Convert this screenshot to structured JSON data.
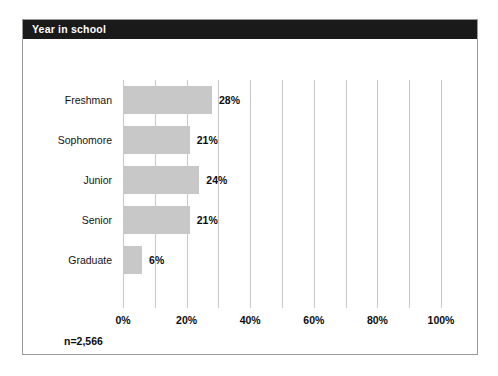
{
  "panel": {
    "title": "Year in school"
  },
  "sample_size_label": "n=2,566",
  "colors": {
    "header_background": "#1a1a1a",
    "header_text": "#ffffff",
    "bar_fill": "#c8c8c8",
    "gridline": "#c9c9c9",
    "panel_border": "#9a9a9a",
    "text": "#0d0d0d",
    "background": "#ffffff"
  },
  "chart_data": {
    "type": "bar",
    "orientation": "horizontal",
    "title": "Year in school",
    "xlabel": "",
    "ylabel": "",
    "categories": [
      "Freshman",
      "Sophomore",
      "Junior",
      "Senior",
      "Graduate"
    ],
    "values": [
      28,
      21,
      24,
      21,
      6
    ],
    "value_labels": [
      "28%",
      "21%",
      "24%",
      "21%",
      "6%"
    ],
    "xlim": [
      0,
      100
    ],
    "xticks": [
      0,
      20,
      40,
      60,
      80,
      100
    ],
    "xtick_labels": [
      "0%",
      "20%",
      "40%",
      "60%",
      "80%",
      "100%"
    ],
    "grid": true,
    "gridline_interval": 10,
    "gridlines": [
      0,
      10,
      20,
      30,
      40,
      50,
      60,
      70,
      80,
      90,
      100
    ],
    "legend": false,
    "annotations": [
      "n=2,566"
    ]
  }
}
